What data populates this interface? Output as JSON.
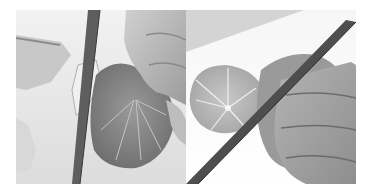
{
  "figure": {
    "panels": [
      {
        "id": "left",
        "description": "Hand holding a peeled citrus fruit while a chef's knife slices away the peel and pith; removed peel pieces on the left"
      },
      {
        "id": "right",
        "description": "Hand holding a citrus fruit with a knife blade diagonally cutting; a cross-section slice of citrus showing segments in the background"
      }
    ],
    "style": {
      "palette": "grayscale",
      "background": "#ffffff",
      "board": "#e6e6e6",
      "fruit": "#8a8a8a",
      "skin": "#b5b5b5",
      "blade": "#5a5a5a"
    }
  }
}
